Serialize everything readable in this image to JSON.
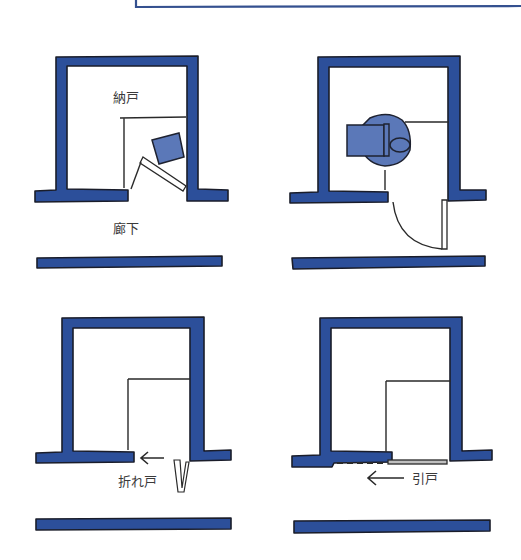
{
  "figure": {
    "title_box": {
      "visible_portion": "bottom-left corner of a framed caption box"
    },
    "colors": {
      "wall": "#2c4f9a",
      "wall_outline": "#1a1d2a",
      "furniture": "#5b78b8",
      "line": "#2a2a2a",
      "text": "#3a3a3a",
      "background": "#ffffff"
    },
    "panels": [
      {
        "id": "hinged-door-inward",
        "labels": {
          "room": "納戸",
          "corridor": "廊下"
        },
        "description": "Storage room with inward swinging door blocked by an object"
      },
      {
        "id": "hinged-door-outward-wheelchair",
        "labels": {},
        "description": "Storage room with outward swinging door and a wheelchair inside"
      },
      {
        "id": "folding-door",
        "labels": {
          "door_type": "折れ戸",
          "arrow": "←"
        },
        "description": "Storage room with a folding door"
      },
      {
        "id": "sliding-door",
        "labels": {
          "door_type": "引戸",
          "arrow": "←"
        },
        "description": "Storage room with a sliding door"
      }
    ]
  }
}
